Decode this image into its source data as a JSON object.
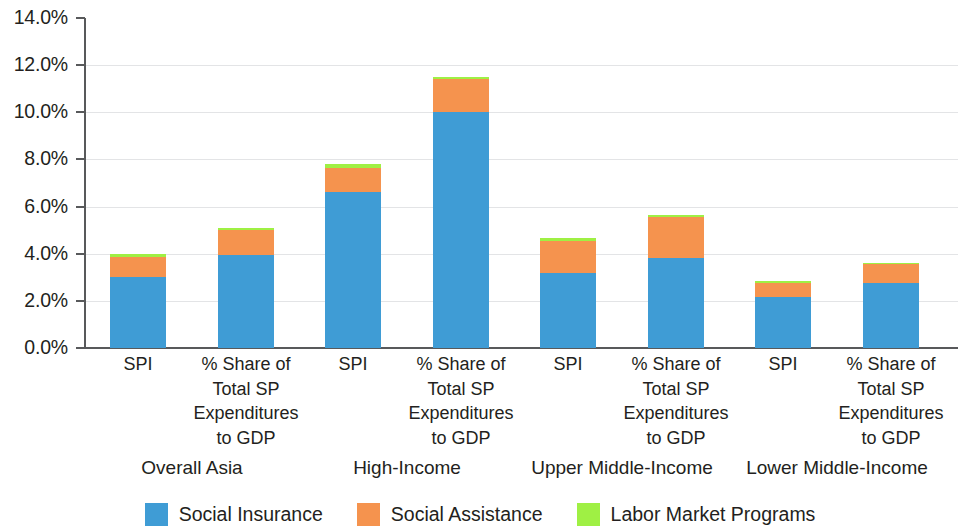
{
  "chart_data": {
    "type": "bar",
    "title": "",
    "subtitle": "",
    "xlabel": "",
    "ylabel": "",
    "stacked": true,
    "grid": true,
    "legend_position": "bottom",
    "ylim": [
      0,
      14
    ],
    "y_ticks": [
      "0.0%",
      "2.0%",
      "4.0%",
      "6.0%",
      "8.0%",
      "10.0%",
      "12.0%",
      "14.0%"
    ],
    "y_tick_values": [
      0,
      2,
      4,
      6,
      8,
      10,
      12,
      14
    ],
    "categories": [
      "SPI",
      "% Share of Total SP Expenditures to GDP",
      "SPI",
      "% Share of Total SP Expenditures to GDP",
      "SPI",
      "% Share of Total SP Expenditures to GDP",
      "SPI",
      "% Share of Total SP Expenditures to GDP"
    ],
    "category_lines": [
      [
        "SPI"
      ],
      [
        "% Share of",
        "Total SP",
        "Expenditures",
        "to GDP"
      ],
      [
        "SPI"
      ],
      [
        "% Share of",
        "Total SP",
        "Expenditures",
        "to GDP"
      ],
      [
        "SPI"
      ],
      [
        "% Share of",
        "Total SP",
        "Expenditures",
        "to GDP"
      ],
      [
        "SPI"
      ],
      [
        "% Share of",
        "Total SP",
        "Expenditures",
        "to GDP"
      ]
    ],
    "groups": [
      {
        "label": "Overall Asia",
        "categories": [
          0,
          1
        ]
      },
      {
        "label": "High-Income",
        "categories": [
          2,
          3
        ]
      },
      {
        "label": "Upper Middle-Income",
        "categories": [
          4,
          5
        ]
      },
      {
        "label": "Lower Middle-Income",
        "categories": [
          6,
          7
        ]
      }
    ],
    "series": [
      {
        "name": "Social Insurance",
        "color": "#3f9cd5",
        "values": [
          3.0,
          3.95,
          6.6,
          10.0,
          3.2,
          3.8,
          2.15,
          2.75
        ]
      },
      {
        "name": "Social Assistance",
        "color": "#f5934e",
        "values": [
          0.85,
          1.05,
          1.05,
          1.4,
          1.35,
          1.75,
          0.6,
          0.8
        ]
      },
      {
        "name": "Labor Market Programs",
        "color": "#9ff044",
        "values": [
          0.15,
          0.1,
          0.15,
          0.1,
          0.1,
          0.1,
          0.08,
          0.05
        ]
      }
    ],
    "totals": [
      4.0,
      5.1,
      7.8,
      11.5,
      4.65,
      5.65,
      2.83,
      3.6
    ]
  },
  "legend": {
    "items": [
      {
        "label": "Social Insurance",
        "color": "#3f9cd5"
      },
      {
        "label": "Social Assistance",
        "color": "#f5934e"
      },
      {
        "label": "Labor Market Programs",
        "color": "#9ff044"
      }
    ]
  }
}
